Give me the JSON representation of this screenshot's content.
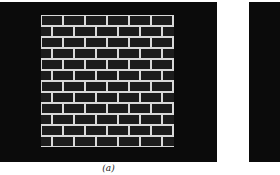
{
  "figure": {
    "panels": [
      {
        "id": "a",
        "caption": "(a)",
        "content": "brick-wall-texture-image"
      },
      {
        "id": "b",
        "caption": "",
        "content": "dark-image-partially-visible"
      }
    ],
    "brick_pattern": {
      "rows": 12,
      "bricks_per_row": 6,
      "brick_width_px": 22,
      "brick_height_px": 11,
      "mortar_color": "#d9d9d9",
      "brick_color": "#1c1c1c",
      "background_color": "#0b0b0b"
    }
  }
}
